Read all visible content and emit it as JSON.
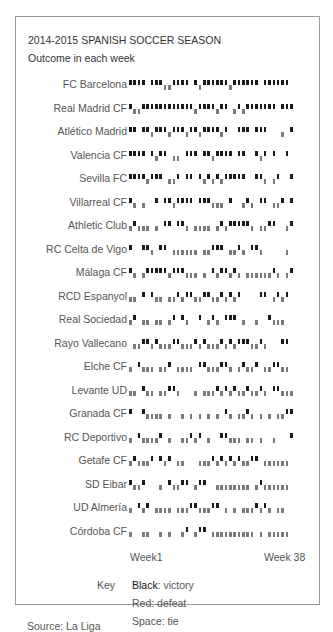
{
  "chart_data": {
    "type": "heatmap",
    "title": "2014-2015 SPANISH SOCCER SEASON",
    "subtitle": "Outcome in each week",
    "xlabel_start": "Week1",
    "xlabel_end": "Week 38",
    "weeks": 38,
    "encoding": {
      "W": "victory (black, upper)",
      "L": "defeat (red/gray, lower)",
      "D": "tie (space)"
    },
    "teams": [
      {
        "name": "FC Barcelona",
        "results": "WWWWDWWWLLWWWWDWLWWWWWWLWWWWWWDWWWWWW"
      },
      {
        "name": "Real Madrid CF",
        "results": "WLLWWWWWWWWWWWWLWWWWLWWDLWLWWWWWWWDWWW"
      },
      {
        "name": "Atlético Madrid",
        "results": "WWDWWLWWWLWWWLWWLWWWWLWDDWWWDWWWDDDLDW"
      },
      {
        "name": "Valencia CF",
        "results": "WWWWDWLWWDLLDWWWDWWLWWWWDWWDDWLWDWDDWD"
      },
      {
        "name": "Sevilla FC",
        "results": "WWWWLWWWDLLWDWWDWLWLWLWWWWWDDWWLDLWDDW"
      },
      {
        "name": "Villarreal CF",
        "results": "WLDLDDWDWWLWWWWDWWWLLLDWDDLWLDWWDLLWDW"
      },
      {
        "name": "Athletic Club",
        "results": "LWLLLDLDWWDWWLDLLLLDLWLWWWWWLDLLWWDDLW"
      },
      {
        "name": "RC Celta de Vigo",
        "results": "WDDWWLDWWDLLLLLLDLLWWWDLLWLDWWLDDDDDLD"
      },
      {
        "name": "Málaga CF",
        "results": "WLDLWWWWWLWWWLLLDLDWLWWLWLDLLLLLLWLDLW"
      },
      {
        "name": "RCD Espanyol",
        "results": "LLDWDWLLDLLWLWWLLWWLLWLWLWDDDDWWDLWLWD"
      },
      {
        "name": "Real Sociedad",
        "results": "LWDLLDLLDLWDWLDDWDLWLDWWWDLDDLDDWLLLDD"
      },
      {
        "name": "Rayo Vallecano",
        "results": "DLLWWLWLLLWWLLLWLWLLLWLWLWWWLLWLDDDWWD"
      },
      {
        "name": "Elche CF",
        "results": "LDWLLLDLLWDLLLLDWWLLLWWLDLWLLWDLLWWLLD"
      },
      {
        "name": "Levante UD",
        "results": "LLDWLLDLLWWLDDDLDLLLWLWLWLLWLLWLDWWLLL"
      },
      {
        "name": "Granada CF",
        "results": "WDDWLLLLDLDDLDLDLDLDLDWLDLLWLDLDLDLLWW"
      },
      {
        "name": "RC Deportivo",
        "results": "LDWLLLLWDLDDLLWLWDLDDWWLLLDLLDLDDLDDDW"
      },
      {
        "name": "Getafe CF",
        "results": "LWLLLWDWLWDLLDDDLLLWLWLWLWLLWWDLLLLLLD"
      },
      {
        "name": "SD Eibar",
        "results": "WLLWDDDLDWLLWWDLWWDDLLLLLLLLDLWLLLLLLD"
      },
      {
        "name": "UD Almería",
        "results": "LDWLWDLLLLDLLLWWLLLWWDLDLDLLLWLWLDLLDD"
      },
      {
        "name": "Córdoba CF",
        "results": "LDDLLDDLDLDDLWDLWWDLLLLLLLLLLDLDLLLLLD"
      }
    ]
  },
  "axis": {
    "start": "Week1",
    "end": "Week 38"
  },
  "key": {
    "label": "Key",
    "victory_color": "Black",
    "victory_text": ": victory",
    "defeat": "Red: defeat",
    "tie": "Space: tie"
  },
  "source": "Source: La Liga"
}
